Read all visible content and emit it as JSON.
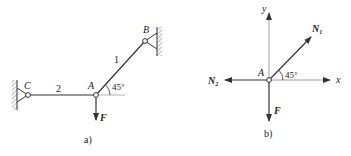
{
  "figure_a": {
    "caption": "a)",
    "nodes": {
      "A": "A",
      "B": "B",
      "C": "C"
    },
    "members": {
      "bar1": "1",
      "bar2": "2"
    },
    "angle": "45°",
    "force": "F"
  },
  "figure_b": {
    "caption": "b)",
    "node": "A",
    "axes": {
      "x": "x",
      "y": "y"
    },
    "forces": {
      "N1": "N",
      "N1_sub": "1",
      "N2": "N",
      "N2_sub": "2",
      "F": "F"
    },
    "angle": "45°"
  },
  "colors": {
    "line": "#333333",
    "thin": "#888888",
    "text": "#222222"
  }
}
